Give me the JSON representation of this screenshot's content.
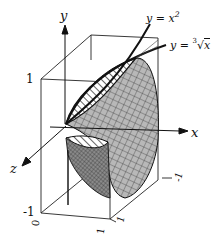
{
  "figure": {
    "axes": {
      "x_label": "x",
      "y_label": "y",
      "z_label": "z"
    },
    "curves": {
      "parabola_label_lhs": "y = x",
      "parabola_exponent": "2",
      "cuberoot_label_lhs": "y = ",
      "cuberoot_index": "3",
      "cuberoot_radicand": "x"
    },
    "ticks": {
      "y_top": "1",
      "y_bottom": "-1",
      "z_zero": "0",
      "z_front": "1",
      "x_back": "-1",
      "x_front": "1"
    },
    "colors": {
      "ink": "#111111",
      "surface_fill": "#9a9a9a",
      "surface_dark": "#6e6e6e",
      "background": "#ffffff"
    }
  }
}
